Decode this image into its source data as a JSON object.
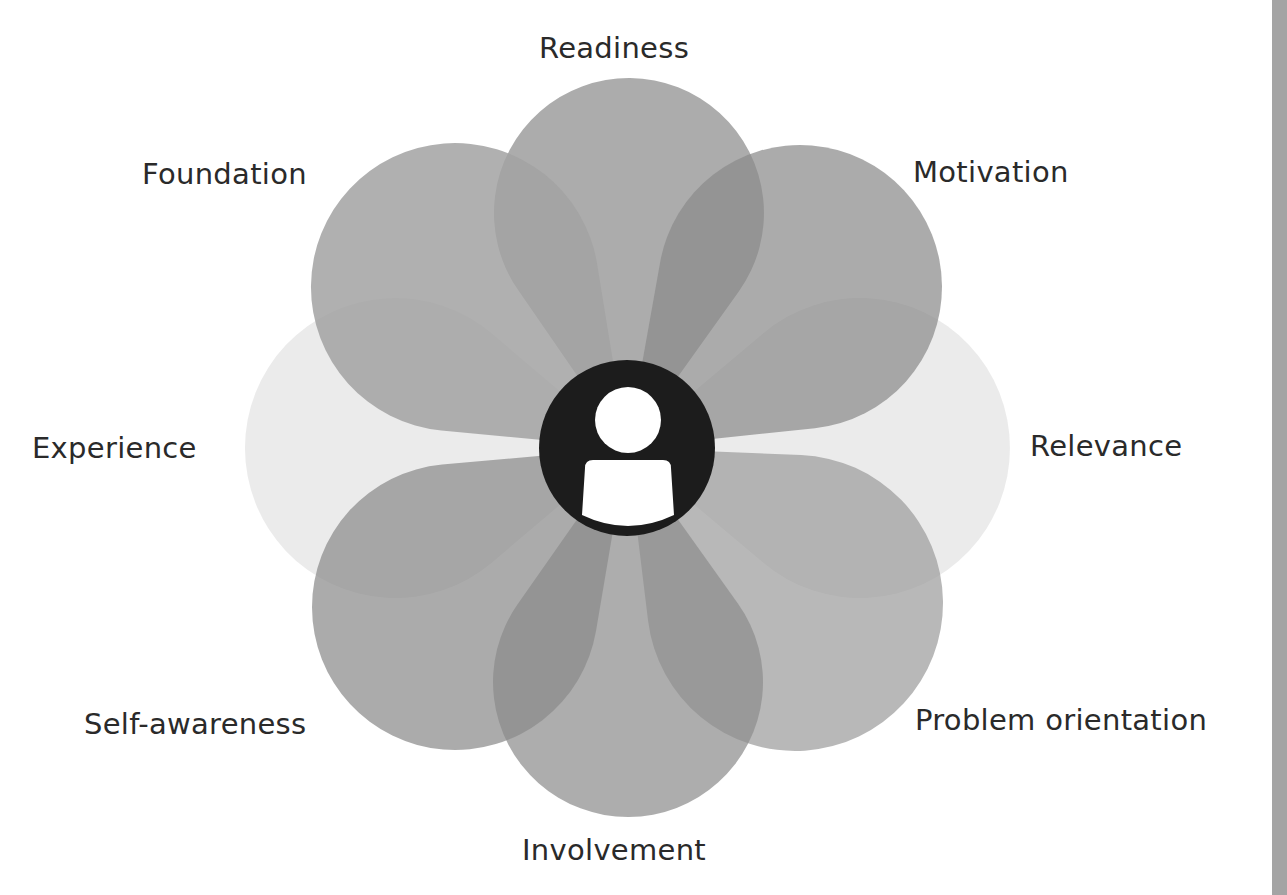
{
  "diagram": {
    "center": {
      "x": 627,
      "y": 448
    },
    "hub": {
      "radius": 88,
      "fill": "#1c1c1c",
      "person_color": "#ffffff",
      "icon": "person-icon"
    },
    "petals": [
      {
        "id": "experience",
        "label": "Experience",
        "cx": 395,
        "cy": 448,
        "r": 150,
        "fill": "#e4e4e4",
        "opacity": 0.75
      },
      {
        "id": "relevance",
        "label": "Relevance",
        "cx": 860,
        "cy": 448,
        "r": 150,
        "fill": "#e4e4e4",
        "opacity": 0.75
      },
      {
        "id": "readiness",
        "label": "Readiness",
        "cx": 629,
        "cy": 213,
        "r": 135,
        "fill": "#8c8c8c",
        "opacity": 0.72
      },
      {
        "id": "motivation",
        "label": "Motivation",
        "cx": 800,
        "cy": 287,
        "r": 142,
        "fill": "#8a8a8a",
        "opacity": 0.72
      },
      {
        "id": "problem-orientation",
        "label": "Problem orientation",
        "cx": 795,
        "cy": 603,
        "r": 148,
        "fill": "#9c9c9c",
        "opacity": 0.72
      },
      {
        "id": "involvement",
        "label": "Involvement",
        "cx": 628,
        "cy": 682,
        "r": 135,
        "fill": "#8e8e8e",
        "opacity": 0.72
      },
      {
        "id": "self-awareness",
        "label": "Self-awareness",
        "cx": 455,
        "cy": 607,
        "r": 143,
        "fill": "#8a8a8a",
        "opacity": 0.72
      },
      {
        "id": "foundation",
        "label": "Foundation",
        "cx": 455,
        "cy": 287,
        "r": 144,
        "fill": "#a2a2a2",
        "opacity": 0.85
      }
    ]
  },
  "labels": {
    "readiness": "Readiness",
    "motivation": "Motivation",
    "relevance": "Relevance",
    "problem_orientation": "Problem orientation",
    "involvement": "Involvement",
    "self_awareness": "Self-awareness",
    "experience": "Experience",
    "foundation": "Foundation"
  },
  "colors": {
    "text": "#2a2a2a",
    "right_bar": "#a4a4a4"
  }
}
